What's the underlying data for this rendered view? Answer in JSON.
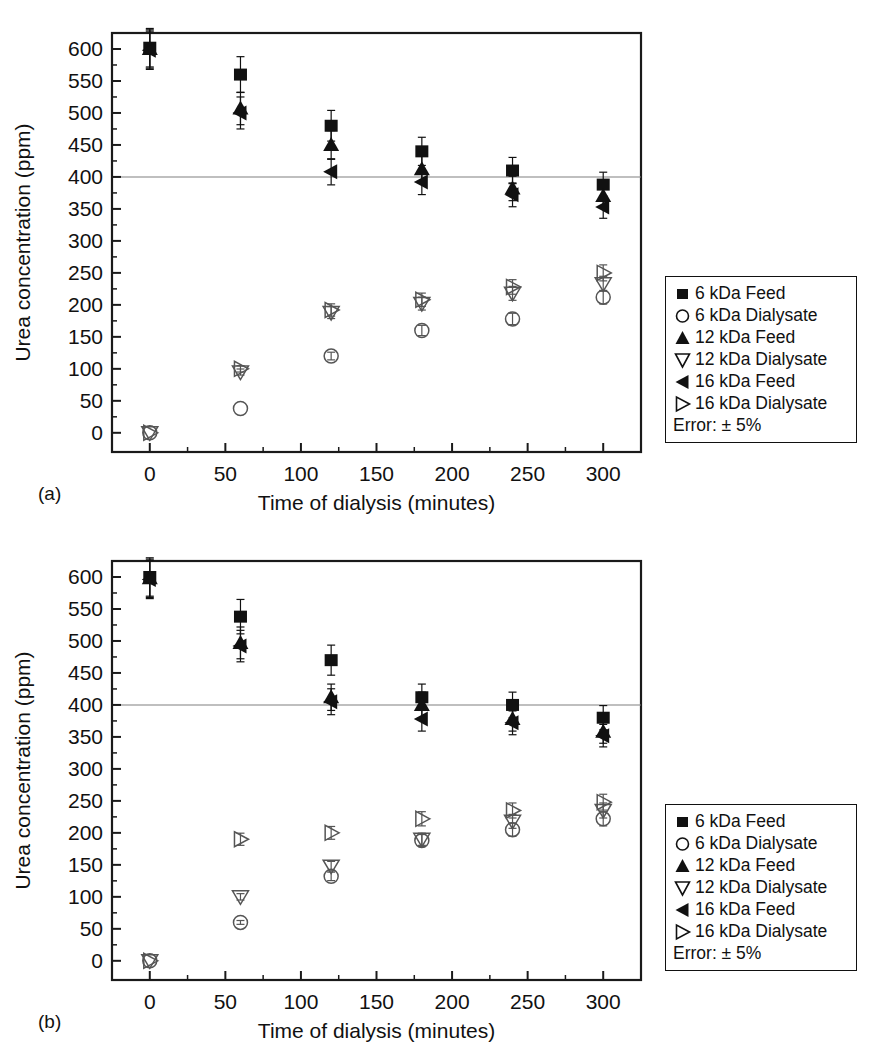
{
  "figure": {
    "panels": [
      {
        "id": "a",
        "caption": "(a)",
        "xlabel": "Time of dialysis (minutes)",
        "ylabel": "Urea concentration (ppm)"
      },
      {
        "id": "b",
        "caption": "(b)",
        "xlabel": "Time of dialysis (minutes)",
        "ylabel": "Urea concentration (ppm)"
      }
    ]
  },
  "legend": {
    "entries": [
      {
        "symbol": "filled-square",
        "label": "6 kDa Feed"
      },
      {
        "symbol": "open-circle",
        "label": "6 kDa Dialysate"
      },
      {
        "symbol": "filled-triangle-up",
        "label": "12 kDa Feed"
      },
      {
        "symbol": "open-triangle-down",
        "label": "12 kDa Dialysate"
      },
      {
        "symbol": "filled-triangle-left",
        "label": "16 kDa Feed"
      },
      {
        "symbol": "open-triangle-right",
        "label": "16 kDa Dialysate"
      }
    ],
    "error_note_a": "Error: ± 5%",
    "error_note_b": "Error: ± 5%"
  },
  "axes": {
    "x_ticks": [
      0,
      50,
      100,
      150,
      200,
      250,
      300
    ],
    "x_tick_labels": [
      "0",
      "50",
      "100",
      "150",
      "200",
      "250",
      "300"
    ],
    "xlim": [
      -25,
      325
    ],
    "x_minor_step": 25,
    "y_ticks": [
      0,
      50,
      100,
      150,
      200,
      250,
      300,
      350,
      400,
      450,
      500,
      550,
      600
    ],
    "y_tick_labels": [
      "0",
      "50",
      "100",
      "150",
      "200",
      "250",
      "300",
      "350",
      "400",
      "450",
      "500",
      "550",
      "600"
    ],
    "ylim": [
      -30,
      625
    ],
    "y_minor_step": 25,
    "reference_line_y": 400
  },
  "colors": {
    "marker_filled": "#111111",
    "marker_open_stroke": "#555555",
    "axis": "#1a1a1a",
    "reference_line": "#808080",
    "background": "#ffffff"
  },
  "chart_data": [
    {
      "type": "scatter",
      "panel": "a",
      "title": "",
      "xlabel": "Time of dialysis (minutes)",
      "ylabel": "Urea concentration (ppm)",
      "xlim": [
        -25,
        325
      ],
      "ylim": [
        -30,
        625
      ],
      "grid": false,
      "legend_position": "right-outside",
      "error_percent": 5,
      "x": [
        0,
        60,
        120,
        180,
        240,
        300
      ],
      "series": [
        {
          "name": "6 kDa Feed",
          "symbol": "filled-square",
          "values": [
            602,
            560,
            480,
            440,
            410,
            388
          ]
        },
        {
          "name": "6 kDa Dialysate",
          "symbol": "open-circle",
          "values": [
            0,
            38,
            120,
            160,
            178,
            212
          ]
        },
        {
          "name": "12 kDa Feed",
          "symbol": "filled-triangle-up",
          "values": [
            600,
            507,
            450,
            412,
            382,
            370
          ]
        },
        {
          "name": "12 kDa Dialysate",
          "symbol": "open-triangle-down",
          "values": [
            0,
            95,
            188,
            202,
            218,
            233
          ]
        },
        {
          "name": "16 kDa Feed",
          "symbol": "filled-triangle-left",
          "values": [
            598,
            500,
            408,
            392,
            372,
            353
          ]
        },
        {
          "name": "16 kDa Dialysate",
          "symbol": "open-triangle-right",
          "values": [
            0,
            100,
            192,
            208,
            228,
            250
          ]
        }
      ]
    },
    {
      "type": "scatter",
      "panel": "b",
      "title": "",
      "xlabel": "Time of dialysis (minutes)",
      "ylabel": "Urea concentration (ppm)",
      "xlim": [
        -25,
        325
      ],
      "ylim": [
        -30,
        625
      ],
      "grid": false,
      "legend_position": "right-outside",
      "error_percent": 5,
      "x": [
        0,
        60,
        120,
        180,
        240,
        300
      ],
      "series": [
        {
          "name": "6 kDa Feed",
          "symbol": "filled-square",
          "values": [
            600,
            538,
            470,
            412,
            400,
            380
          ]
        },
        {
          "name": "6 kDa Dialysate",
          "symbol": "open-circle",
          "values": [
            0,
            60,
            132,
            188,
            205,
            222
          ]
        },
        {
          "name": "12 kDa Feed",
          "symbol": "filled-triangle-up",
          "values": [
            598,
            497,
            412,
            400,
            378,
            358
          ]
        },
        {
          "name": "12 kDa Dialysate",
          "symbol": "open-triangle-down",
          "values": [
            0,
            100,
            148,
            190,
            218,
            235
          ]
        },
        {
          "name": "16 kDa Feed",
          "symbol": "filled-triangle-left",
          "values": [
            596,
            492,
            405,
            378,
            372,
            352
          ]
        },
        {
          "name": "16 kDa Dialysate",
          "symbol": "open-triangle-right",
          "values": [
            0,
            190,
            200,
            222,
            235,
            248
          ]
        }
      ]
    }
  ]
}
